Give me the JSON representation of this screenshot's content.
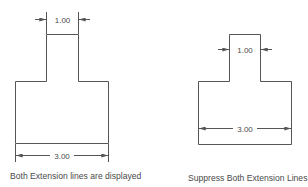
{
  "figures": [
    {
      "id": "left",
      "caption": "Both Extension lines are displayed",
      "top_dimension": "1.00",
      "bottom_dimension": "3.00"
    },
    {
      "id": "right",
      "caption": "Suppress Both Extension Lines",
      "top_dimension": "1.00",
      "bottom_dimension": "3.00"
    }
  ],
  "colors": {
    "line": "#555555",
    "text": "#4a4a4a",
    "background": "#ffffff"
  }
}
